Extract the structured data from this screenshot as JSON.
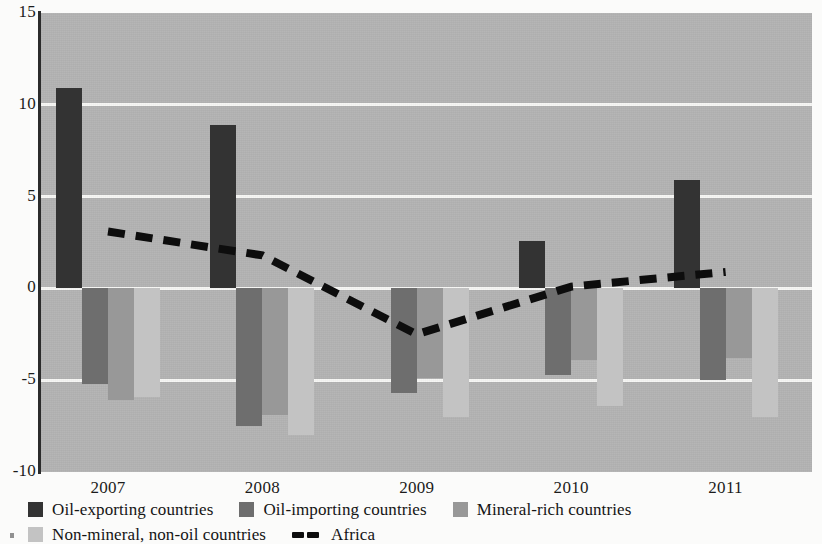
{
  "chart_data": {
    "type": "bar",
    "title": "",
    "subtitle": "",
    "xlabel": "",
    "ylabel": "",
    "ylim": [
      -10,
      15
    ],
    "yticks": [
      15,
      10,
      5,
      0,
      -5,
      -10
    ],
    "ytick_labels": [
      "15",
      "10",
      "5",
      "0",
      "-5",
      "-10"
    ],
    "grid": true,
    "gridlines_at": [
      10,
      5,
      0,
      -5
    ],
    "legend_position": "bottom-left",
    "categories": [
      "2007",
      "2008",
      "2009",
      "2010",
      "2011"
    ],
    "series": [
      {
        "name": "Oil-exporting countries",
        "type": "bar",
        "color": "#333333",
        "values": [
          10.9,
          8.9,
          0.0,
          2.6,
          5.9
        ]
      },
      {
        "name": "Oil-importing countries",
        "type": "bar",
        "color": "#6e6e6e",
        "values": [
          -5.2,
          -7.5,
          -5.7,
          -4.7,
          -5.0
        ]
      },
      {
        "name": "Mineral-rich countries",
        "type": "bar",
        "color": "#989898",
        "values": [
          -6.1,
          -6.9,
          -4.9,
          -3.9,
          -3.8
        ]
      },
      {
        "name": "Non-mineral, non-oil countries",
        "type": "bar",
        "color": "#c3c3c3",
        "values": [
          -5.9,
          -8.0,
          -7.0,
          -6.4,
          -7.0
        ]
      },
      {
        "name": "Africa",
        "type": "line",
        "style": "dashed",
        "color": "#0d0d0d",
        "values": [
          3.1,
          1.8,
          -2.5,
          0.1,
          0.9
        ]
      }
    ]
  },
  "axes": {
    "y_ticks": [
      {
        "label": "15",
        "value": 15
      },
      {
        "label": "10",
        "value": 10
      },
      {
        "label": "5",
        "value": 5
      },
      {
        "label": "0",
        "value": 0
      },
      {
        "label": "-5",
        "value": -5
      },
      {
        "label": "-10",
        "value": -10
      }
    ],
    "x_ticks": [
      {
        "label": "2007"
      },
      {
        "label": "2008"
      },
      {
        "label": "2009"
      },
      {
        "label": "2010"
      },
      {
        "label": "2011"
      }
    ]
  },
  "legend": {
    "row1": [
      {
        "label": "Oil-exporting countries",
        "swatch": "#333333",
        "marker": "square"
      },
      {
        "label": "Oil-importing countries",
        "swatch": "#6e6e6e",
        "marker": "square"
      },
      {
        "label": "Mineral-rich countries",
        "swatch": "#989898",
        "marker": "square"
      }
    ],
    "row2": [
      {
        "label": "Non-mineral, non-oil countries",
        "swatch": "#c3c3c3",
        "marker": "square"
      },
      {
        "label": "Africa",
        "swatch": "#0d0d0d",
        "marker": "dashed-line"
      }
    ]
  },
  "colors": {
    "plot_background": "#b4b4b4",
    "gridline": "#f7f7f5",
    "axis": "#2b2b2b",
    "page_background": "#fbfbfa"
  }
}
